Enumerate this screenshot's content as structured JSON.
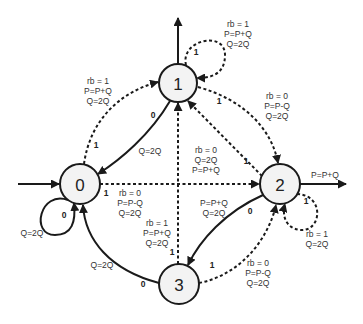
{
  "diagram": {
    "type": "state-machine",
    "nodes": [
      {
        "id": "0",
        "label": "0",
        "cx": 80,
        "cy": 184
      },
      {
        "id": "1",
        "label": "1",
        "cx": 178,
        "cy": 83
      },
      {
        "id": "2",
        "label": "2",
        "cx": 280,
        "cy": 184
      },
      {
        "id": "3",
        "label": "3",
        "cx": 179,
        "cy": 284
      }
    ],
    "edges": [
      {
        "from": "start",
        "to": "0",
        "style": "solid",
        "bit": "",
        "lines": []
      },
      {
        "from": "0",
        "to": "0",
        "style": "solid",
        "bit": "0",
        "lines": [
          "Q=2Q"
        ]
      },
      {
        "from": "0",
        "to": "1",
        "style": "dashed",
        "bit": "1",
        "lines": [
          "rb = 1",
          "P=P+Q",
          "Q=2Q"
        ]
      },
      {
        "from": "0",
        "to": "2",
        "style": "dashed",
        "bit": "1",
        "lines": [
          "rb = 0",
          "P=P-Q",
          "Q=2Q"
        ]
      },
      {
        "from": "1",
        "to": "0",
        "style": "solid",
        "bit": "0",
        "lines": [
          "Q=2Q"
        ]
      },
      {
        "from": "1",
        "to": "1",
        "style": "dashed",
        "bit": "1",
        "lines": [
          "rb = 1",
          "P=P+Q",
          "Q=2Q"
        ]
      },
      {
        "from": "1",
        "to": "2",
        "style": "dashed",
        "bit": "1",
        "lines": [
          "rb = 0",
          "P=P-Q",
          "Q=2Q"
        ]
      },
      {
        "from": "1",
        "to": "output",
        "style": "solid",
        "bit": "",
        "lines": []
      },
      {
        "from": "2",
        "to": "1",
        "style": "dashed",
        "bit": "1",
        "lines": [
          "rb = 0",
          "Q=2Q",
          "P=P+Q"
        ]
      },
      {
        "from": "2",
        "to": "2",
        "style": "dashed",
        "bit": "1",
        "lines": [
          "rb = 1",
          "Q=2Q"
        ]
      },
      {
        "from": "2",
        "to": "3",
        "style": "solid",
        "bit": "0",
        "lines": [
          "P=P+Q",
          "Q=2Q"
        ]
      },
      {
        "from": "2",
        "to": "output",
        "style": "solid",
        "bit": "",
        "lines": [
          "P=P+Q"
        ]
      },
      {
        "from": "3",
        "to": "0",
        "style": "solid",
        "bit": "0",
        "lines": [
          "Q=2Q"
        ]
      },
      {
        "from": "3",
        "to": "1",
        "style": "dashed",
        "bit": "1",
        "lines": [
          "rb = 1",
          "P=P+Q",
          "Q=2Q"
        ]
      },
      {
        "from": "3",
        "to": "2",
        "style": "dashed",
        "bit": "1",
        "lines": [
          "rb = 0",
          "P=P-Q",
          "Q=2Q"
        ]
      }
    ]
  },
  "labels": {
    "n0": "0",
    "n1": "1",
    "n2": "2",
    "n3": "3",
    "e01": {
      "bit": "1",
      "l1": "rb = 1",
      "l2": "P=P+Q",
      "l3": "Q=2Q"
    },
    "e11": {
      "bit": "1",
      "l1": "rb = 1",
      "l2": "P=P+Q",
      "l3": "Q=2Q"
    },
    "e12": {
      "bit": "1",
      "l1": "rb = 0",
      "l2": "P=P-Q",
      "l3": "Q=2Q"
    },
    "e10": {
      "bit": "0",
      "l1": "Q=2Q"
    },
    "e21": {
      "bit": "1",
      "l1": "rb = 0",
      "l2": "Q=2Q",
      "l3": "P=P+Q"
    },
    "e02": {
      "bit": "1",
      "l1": "rb = 0",
      "l2": "P=P-Q",
      "l3": "Q=2Q"
    },
    "e00": {
      "bit": "0",
      "l1": "Q=2Q"
    },
    "e2out": {
      "l1": "P=P+Q"
    },
    "e22": {
      "bit": "1",
      "l1": "rb = 1",
      "l2": "Q=2Q"
    },
    "e23": {
      "bit": "0",
      "l1": "P=P+Q",
      "l2": "Q=2Q"
    },
    "e31": {
      "bit": "1",
      "l1": "rb = 1",
      "l2": "P=P+Q",
      "l3": "Q=2Q"
    },
    "e30": {
      "bit": "0",
      "l1": "Q=2Q"
    },
    "e32": {
      "bit": "1",
      "l1": "rb = 0",
      "l2": "P=P-Q",
      "l3": "Q=2Q"
    }
  },
  "colors": {
    "stroke": "#1a1a1a",
    "node_fill": "#f3f3f3",
    "background": "#ffffff"
  }
}
